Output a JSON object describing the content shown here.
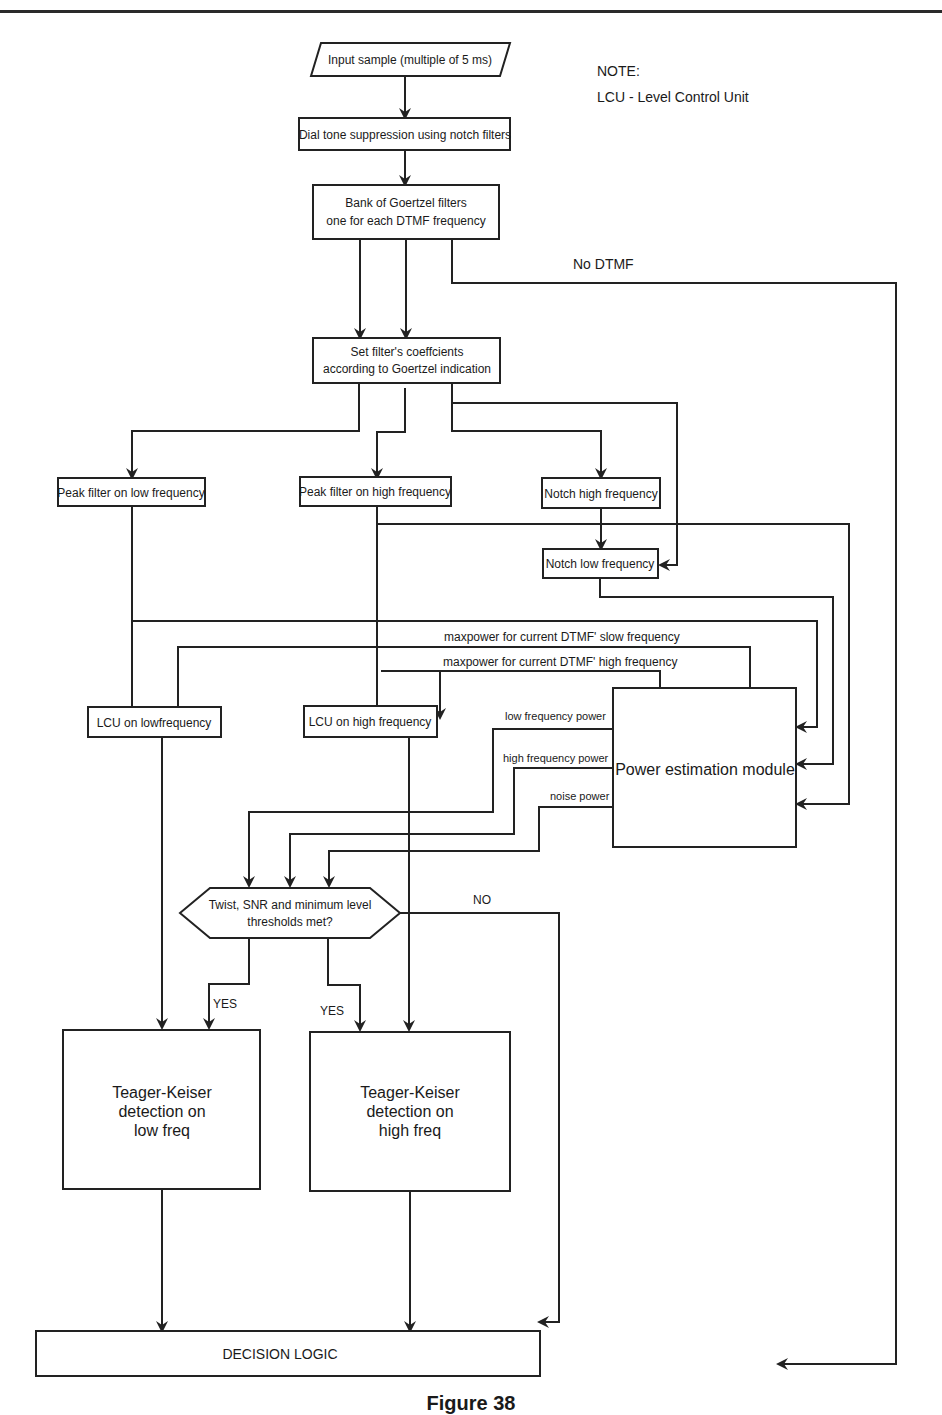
{
  "diagram": {
    "type": "flowchart",
    "note": {
      "heading": "NOTE:",
      "text": "LCU - Level Control Unit"
    },
    "nodes": {
      "input": "Input sample (multiple of 5 ms)",
      "dial_tone": "Dial tone suppression using notch filters",
      "goertzel_line1": "Bank of Goertzel filters",
      "goertzel_line2": "one for each DTMF frequency",
      "coeff_line1": "Set filter's coeffcients",
      "coeff_line2": "according to Goertzel indication",
      "peak_low": "Peak filter on low frequency",
      "peak_high": "Peak filter on high frequency",
      "notch_high": "Notch high frequency",
      "notch_low": "Notch low frequency",
      "lcu_low": "LCU on lowfrequency",
      "lcu_high": "LCU on high frequency",
      "power_module": "Power estimation module",
      "decision_line1": "Twist, SNR and minimum level",
      "decision_line2": "thresholds met?",
      "tk_low_line1": "Teager-Keiser",
      "tk_low_line2": "detection on",
      "tk_low_line3": "low freq",
      "tk_high_line1": "Teager-Keiser",
      "tk_high_line2": "detection on",
      "tk_high_line3": "high freq",
      "decision_logic": "DECISION LOGIC"
    },
    "edge_labels": {
      "no_dtmf": "No DTMF",
      "maxpower_low": "maxpower for current DTMF' slow frequency",
      "maxpower_high": "maxpower for current DTMF' high frequency",
      "low_power": "low frequency power",
      "high_power": "high frequency power",
      "noise_power": "noise power",
      "no": "NO",
      "yes_left": "YES",
      "yes_right": "YES"
    },
    "caption": "Figure 38"
  }
}
